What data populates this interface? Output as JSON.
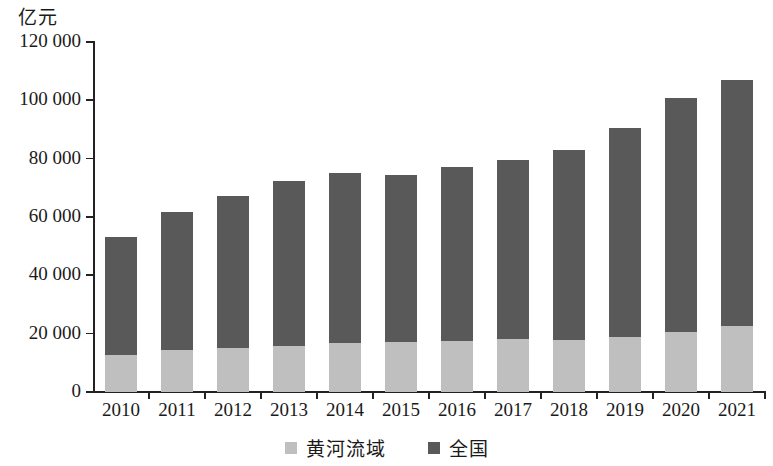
{
  "chart_data": {
    "type": "bar",
    "stacked": true,
    "title": "",
    "subtitle": "",
    "xlabel": "",
    "ylabel": "亿元",
    "unit_label": "亿元",
    "categories": [
      "2010",
      "2011",
      "2012",
      "2013",
      "2014",
      "2015",
      "2016",
      "2017",
      "2018",
      "2019",
      "2020",
      "2021"
    ],
    "ylim": [
      0,
      120000
    ],
    "ytick_values": [
      0,
      20000,
      40000,
      60000,
      80000,
      100000,
      120000
    ],
    "ytick_labels": [
      "0",
      "20 000",
      "40 000",
      "60 000",
      "80 000",
      "100 000",
      "120 000"
    ],
    "grid": false,
    "legend_position": "bottom-center",
    "series": [
      {
        "name": "黄河流域",
        "color": "#bfbfbf",
        "values": [
          12700,
          14400,
          15100,
          15800,
          16700,
          17100,
          17500,
          18100,
          17900,
          18900,
          20600,
          22600
        ]
      },
      {
        "name": "全国",
        "color": "#595959",
        "values": [
          53100,
          61700,
          67200,
          72300,
          75100,
          74400,
          77200,
          79700,
          82900,
          90400,
          100700,
          106900
        ]
      }
    ]
  },
  "legend": {
    "items": [
      {
        "label": "黄河流域",
        "color": "#bfbfbf"
      },
      {
        "label": "全国",
        "color": "#595959"
      }
    ]
  },
  "colors": {
    "series_light": "#bfbfbf",
    "series_dark": "#595959",
    "axis": "#222222",
    "background": "#ffffff"
  }
}
